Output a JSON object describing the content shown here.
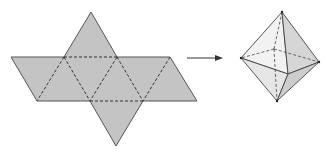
{
  "diagram": {
    "colors": {
      "net_fill": "#c4c4c4",
      "edge": "#555555",
      "fold_line": "#333333",
      "oct_face_light": "#f2f2f2",
      "oct_face_mid": "#e2e2e2",
      "oct_face_dark": "#cfcfcf",
      "arrow": "#333333"
    },
    "net": {
      "faces": 8,
      "outline": [
        [
          91,
          12
        ],
        [
          117,
          57
        ],
        [
          170,
          57
        ],
        [
          197,
          101
        ],
        [
          143,
          101
        ],
        [
          116,
          146
        ],
        [
          90,
          101
        ],
        [
          37,
          101
        ],
        [
          11,
          57
        ],
        [
          64,
          57
        ]
      ],
      "fold_lines": [
        [
          [
            64,
            57
          ],
          [
            117,
            57
          ]
        ],
        [
          [
            90,
            101
          ],
          [
            143,
            101
          ]
        ],
        [
          [
            64,
            57
          ],
          [
            37,
            101
          ]
        ],
        [
          [
            64,
            57
          ],
          [
            90,
            101
          ]
        ],
        [
          [
            117,
            57
          ],
          [
            90,
            101
          ]
        ],
        [
          [
            117,
            57
          ],
          [
            143,
            101
          ]
        ],
        [
          [
            170,
            57
          ],
          [
            143,
            101
          ]
        ]
      ]
    },
    "arrow": {
      "from": [
        187,
        58
      ],
      "to": [
        223,
        58
      ]
    },
    "octahedron": {
      "vertices": {
        "top": [
          282,
          12
        ],
        "left": [
          241,
          58
        ],
        "right": [
          319,
          62
        ],
        "bottom": [
          277,
          101
        ],
        "front": [
          288,
          74
        ],
        "back": [
          274,
          49
        ]
      }
    }
  }
}
